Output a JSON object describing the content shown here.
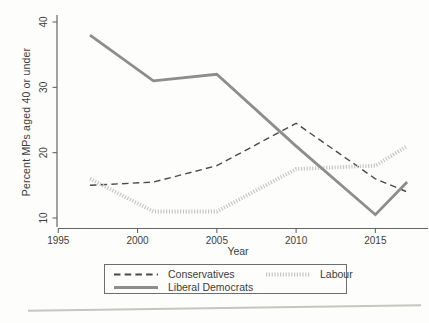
{
  "chart_data": {
    "type": "line",
    "title": "",
    "xlabel": "Year",
    "ylabel": "Percent MPs aged 40 or under",
    "x": [
      1997,
      2001,
      2005,
      2010,
      2015,
      2017
    ],
    "series": [
      {
        "name": "Conservatives",
        "line_style": "dashed",
        "color": "#4a4a4a",
        "values": [
          15,
          15.5,
          18,
          24.5,
          16,
          14
        ]
      },
      {
        "name": "Labour",
        "line_style": "hatched",
        "color": "#c6c6c6",
        "values": [
          16,
          11,
          11,
          17.5,
          18,
          21
        ]
      },
      {
        "name": "Liberal Democrats",
        "line_style": "solid",
        "color": "#8d8d8d",
        "values": [
          38,
          31,
          32,
          21,
          10.5,
          15.5
        ]
      }
    ],
    "xticks": [
      1995,
      2000,
      2005,
      2010,
      2015
    ],
    "yticks": [
      10,
      20,
      30,
      40
    ],
    "xlim": [
      1995,
      2018.5
    ],
    "ylim": [
      8.5,
      41.5
    ],
    "grid": false,
    "legend_position": "bottom-center-box",
    "axis_color": "#666666",
    "text_color": "#3d3d3d"
  }
}
